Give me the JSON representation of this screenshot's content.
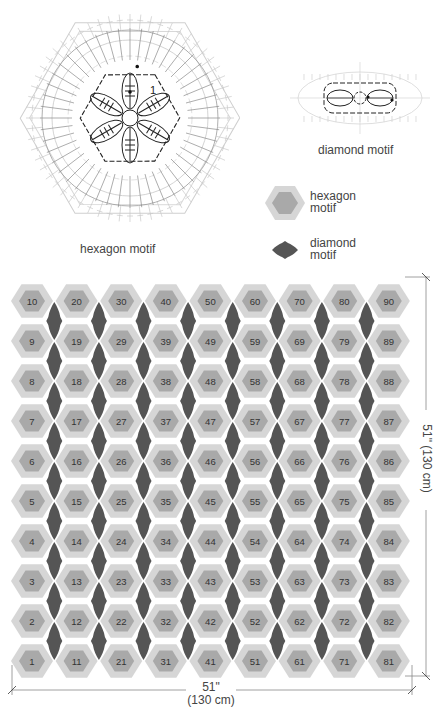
{
  "motif_charts": {
    "hexagon": {
      "caption": "hexagon motif",
      "round_label": "1"
    },
    "diamond": {
      "caption": "diamond motif"
    }
  },
  "legend": {
    "items": [
      {
        "label_line1": "hexagon",
        "label_line2": "motif",
        "symbol": "hexagon-icon"
      },
      {
        "label_line1": "diamond",
        "label_line2": "motif",
        "symbol": "diamond-icon"
      }
    ]
  },
  "assembly": {
    "columns": 9,
    "rows": 10,
    "numbering": "column-wise from bottom-left; column c row r = (c-1)*10 + r",
    "hexagon_numbers_by_row_top_to_bottom": [
      [
        10,
        20,
        30,
        40,
        50,
        60,
        70,
        80,
        90
      ],
      [
        9,
        19,
        29,
        39,
        49,
        59,
        69,
        79,
        89
      ],
      [
        8,
        18,
        28,
        38,
        48,
        58,
        68,
        78,
        88
      ],
      [
        7,
        17,
        27,
        37,
        47,
        57,
        67,
        77,
        87
      ],
      [
        6,
        16,
        26,
        36,
        46,
        56,
        66,
        76,
        86
      ],
      [
        5,
        15,
        25,
        35,
        45,
        55,
        65,
        75,
        85
      ],
      [
        4,
        14,
        24,
        34,
        44,
        54,
        64,
        74,
        84
      ],
      [
        3,
        13,
        23,
        33,
        43,
        53,
        63,
        73,
        83
      ],
      [
        2,
        12,
        22,
        32,
        42,
        52,
        62,
        72,
        82
      ],
      [
        1,
        11,
        21,
        31,
        41,
        51,
        61,
        71,
        81
      ]
    ],
    "colors": {
      "hex_outer": "#d6d6d6",
      "hex_inner": "#a9a9a9",
      "diamond": "#555555",
      "label": "#333333"
    }
  },
  "dimensions": {
    "width": {
      "imperial": "51\"",
      "metric": "(130 cm)"
    },
    "height": {
      "imperial": "51\"",
      "metric": "(130 cm)"
    }
  }
}
